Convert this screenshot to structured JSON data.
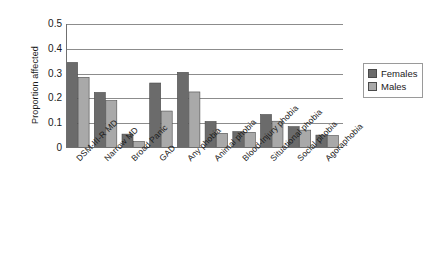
{
  "chart_data": {
    "type": "bar",
    "title": "",
    "xlabel": "",
    "ylabel": "Proportion affected",
    "ylim": [
      0,
      0.5
    ],
    "ytick_labels": [
      "0.5",
      "0.4",
      "0.3",
      "0.2",
      "0.1",
      "0"
    ],
    "ytick_values": [
      0.5,
      0.4,
      0.3,
      0.2,
      0.1,
      0
    ],
    "grid": "horizontal",
    "legend_position": "right",
    "categories": [
      "DSM-III-R MD",
      "Narrow MD",
      "Broad Panic",
      "GAD",
      "Any phobia",
      "Animal phobia",
      "Blood-Injury phobia",
      "Situational phobia",
      "Social phobia",
      "Agoraphobia"
    ],
    "series": [
      {
        "name": "Females",
        "color": "#6b6b6b",
        "values": [
          0.345,
          0.224,
          0.056,
          0.262,
          0.305,
          0.107,
          0.066,
          0.135,
          0.086,
          0.052
        ]
      },
      {
        "name": "Males",
        "color": "#a9a9a9",
        "values": [
          0.285,
          0.191,
          0.026,
          0.149,
          0.226,
          0.059,
          0.063,
          0.108,
          0.072,
          0.05
        ]
      }
    ]
  },
  "legend": {
    "entries": [
      {
        "label": "Females",
        "color": "#6b6b6b"
      },
      {
        "label": "Males",
        "color": "#a9a9a9"
      }
    ]
  },
  "axes": {
    "y_title": "Proportion affected"
  }
}
